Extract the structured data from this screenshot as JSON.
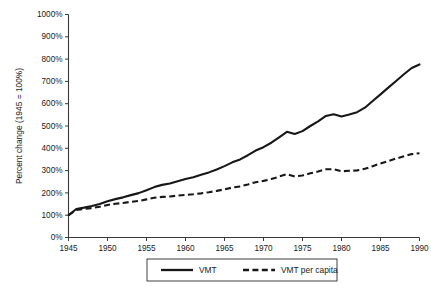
{
  "chart_data": {
    "type": "line",
    "title": "",
    "xlabel": "",
    "ylabel": "Percent change (1945 = 100%)",
    "xlim": [
      1945,
      1990
    ],
    "ylim": [
      0,
      1000
    ],
    "grid": false,
    "legend_position": "bottom",
    "y_tick_labels": [
      "0%",
      "100%",
      "200%",
      "300%",
      "400%",
      "500%",
      "600%",
      "700%",
      "800%",
      "900%",
      "1000%"
    ],
    "y_ticks": [
      0,
      100,
      200,
      300,
      400,
      500,
      600,
      700,
      800,
      900,
      1000
    ],
    "x_tick_labels": [
      "1945",
      "1950",
      "1955",
      "1960",
      "1965",
      "1970",
      "1975",
      "1980",
      "1985",
      "1990"
    ],
    "x_ticks": [
      1945,
      1950,
      1955,
      1960,
      1965,
      1970,
      1975,
      1980,
      1985,
      1990
    ],
    "x": [
      1945,
      1946,
      1947,
      1948,
      1949,
      1950,
      1951,
      1952,
      1953,
      1954,
      1955,
      1956,
      1957,
      1958,
      1959,
      1960,
      1961,
      1962,
      1963,
      1964,
      1965,
      1966,
      1967,
      1968,
      1969,
      1970,
      1971,
      1972,
      1973,
      1974,
      1975,
      1976,
      1977,
      1978,
      1979,
      1980,
      1981,
      1982,
      1983,
      1984,
      1985,
      1986,
      1987,
      1988,
      1989,
      1990
    ],
    "series": [
      {
        "name": "VMT",
        "style": "solid",
        "color": "#17171a",
        "values": [
          100,
          128,
          134,
          141,
          150,
          163,
          172,
          180,
          190,
          199,
          212,
          226,
          236,
          242,
          252,
          262,
          270,
          281,
          292,
          305,
          320,
          337,
          350,
          369,
          390,
          405,
          425,
          449,
          474,
          464,
          477,
          500,
          521,
          545,
          553,
          543,
          552,
          562,
          582,
          612,
          642,
          672,
          702,
          732,
          760,
          776
        ]
      },
      {
        "name": "VMT per capita",
        "style": "dashed",
        "color": "#17171a",
        "values": [
          100,
          124,
          128,
          132,
          138,
          146,
          151,
          155,
          160,
          164,
          171,
          178,
          182,
          184,
          188,
          191,
          194,
          198,
          203,
          209,
          216,
          224,
          229,
          238,
          248,
          254,
          262,
          273,
          284,
          274,
          278,
          288,
          296,
          306,
          306,
          297,
          299,
          301,
          308,
          320,
          332,
          343,
          354,
          364,
          374,
          378
        ]
      }
    ],
    "legend_entries": [
      {
        "label": "VMT",
        "style": "solid"
      },
      {
        "label": "VMT per capita",
        "style": "dashed"
      }
    ]
  }
}
